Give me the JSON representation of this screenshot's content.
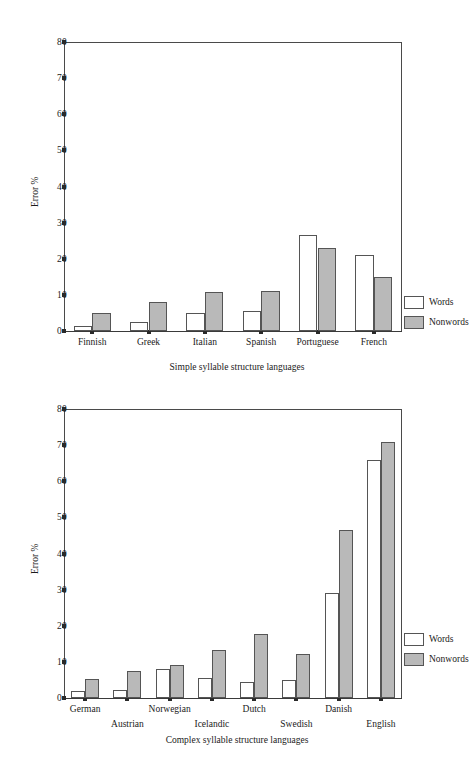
{
  "figures": [
    {
      "id": "figure-top",
      "caption": "Simple syllable structure languages",
      "ylabel": "Error %",
      "legend": {
        "words": "Words",
        "nonwords": "Nonwords"
      },
      "yticks": [
        "0",
        "10",
        "20",
        "30",
        "40",
        "50",
        "60",
        "70",
        "80"
      ],
      "chart_data": {
        "type": "bar",
        "title": "Simple syllable structure languages",
        "xlabel": "Simple syllable structure languages",
        "ylabel": "Error %",
        "ylim": [
          0,
          80
        ],
        "ytick_values": [
          0,
          10,
          20,
          30,
          40,
          50,
          60,
          70,
          80
        ],
        "grid": false,
        "legend_position": "right",
        "categories": [
          "Finnish",
          "Greek",
          "Italian",
          "Spanish",
          "Portuguese",
          "French"
        ],
        "series": [
          {
            "name": "Words",
            "values": [
              1.5,
              2.5,
              5.0,
              5.5,
              26.5,
              21.0
            ]
          },
          {
            "name": "Nonwords",
            "values": [
              5.0,
              8.0,
              10.8,
              11.2,
              23.0,
              15.0
            ]
          }
        ]
      }
    },
    {
      "id": "figure-bottom",
      "caption": "Complex syllable structure languages",
      "ylabel": "Error %",
      "legend": {
        "words": "Words",
        "nonwords": "Nonwords"
      },
      "yticks": [
        "0",
        "10",
        "20",
        "30",
        "40",
        "50",
        "60",
        "70",
        "80"
      ],
      "chart_data": {
        "type": "bar",
        "title": "Complex syllable structure languages",
        "xlabel": "Complex syllable structure languages",
        "ylabel": "Error %",
        "ylim": [
          0,
          80
        ],
        "ytick_values": [
          0,
          10,
          20,
          30,
          40,
          50,
          60,
          70,
          80
        ],
        "grid": false,
        "legend_position": "right",
        "categories": [
          "German",
          "Austrian",
          "Norwegian",
          "Icelandic",
          "Dutch",
          "Swedish",
          "Danish",
          "English"
        ],
        "series": [
          {
            "name": "Words",
            "values": [
              2.0,
              2.2,
              8.0,
              5.5,
              4.5,
              5.0,
              29.0,
              66.0
            ]
          },
          {
            "name": "Nonwords",
            "values": [
              5.2,
              7.5,
              9.0,
              13.2,
              17.8,
              12.3,
              46.5,
              71.0
            ]
          }
        ]
      }
    }
  ],
  "colors": {
    "words_fill": "#ffffff",
    "nonwords_fill": "#b9b9b9",
    "stroke": "#555555"
  }
}
